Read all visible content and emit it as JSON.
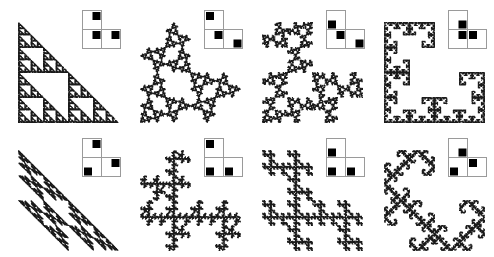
{
  "figure": {
    "fractal_color": "#1a1a1a",
    "glyph_border_color": "#9a9a9a",
    "glyph_mark_color": "#000000",
    "cells": [
      "tl",
      "bl",
      "br"
    ],
    "panels": [
      {
        "id": "p1",
        "row": 0,
        "col": 0,
        "glyph": {
          "tl": "tr",
          "bl": "tr",
          "br": "tr"
        }
      },
      {
        "id": "p2",
        "row": 0,
        "col": 1,
        "glyph": {
          "tl": "tl",
          "bl": "tr",
          "br": "br"
        }
      },
      {
        "id": "p3",
        "row": 0,
        "col": 2,
        "glyph": {
          "tl": "bl",
          "bl": "tr",
          "br": "br"
        }
      },
      {
        "id": "p4",
        "row": 0,
        "col": 3,
        "glyph": {
          "tl": "br",
          "bl": "tr",
          "br": "tl"
        }
      },
      {
        "id": "p5",
        "row": 1,
        "col": 0,
        "glyph": {
          "tl": "tr",
          "bl": "bl",
          "br": "tr"
        }
      },
      {
        "id": "p6",
        "row": 1,
        "col": 1,
        "glyph": {
          "tl": "tl",
          "bl": "bl",
          "br": "bl"
        }
      },
      {
        "id": "p7",
        "row": 1,
        "col": 2,
        "glyph": {
          "tl": "bl",
          "bl": "bl",
          "br": "bl"
        }
      },
      {
        "id": "p8",
        "row": 1,
        "col": 3,
        "glyph": {
          "tl": "br",
          "bl": "bl",
          "br": "tl"
        }
      }
    ]
  }
}
